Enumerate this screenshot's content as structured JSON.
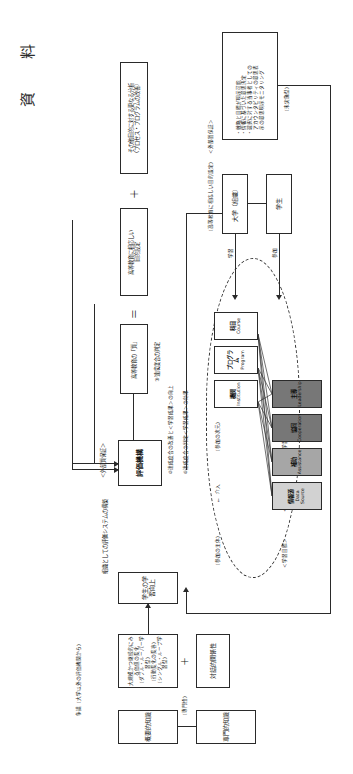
{
  "document": {
    "title": "資　料",
    "orientation": "landscape-rotated"
  },
  "top_boxes": {
    "other_purposes": "その他目的に対する更なる分析\n（プロセス・プログラムの改善）",
    "plus_sign": "＋",
    "target_setting": "高等教育に相応しい\n目的設定",
    "equals_sign": "＝",
    "quality_determination": "高等教育の「質」",
    "measure_quality": "③達成度合の判定",
    "organization_construction": "組織としての評価システムの構築"
  },
  "eval_org": {
    "label": "＜外部質保証＞",
    "box": "評価機構",
    "note_improve": "②達成度合の改善と＜学習成果＞の向上",
    "note_achieve": "①達成度合の判定＜学習成果＞の効果"
  },
  "outcomes": {
    "student_learning": "学生の学習向上",
    "value_add": "大規模かつ継続的にみる価値の変化\n（ダブル・ルーパー学習型）\n（行動変化の変容）\n（シングル・ループ学習型）",
    "interactivity": "対話的関係性",
    "competency": "概要的知識",
    "expertise_field": "専門的知識",
    "expertise_note": "（専門性）",
    "assessment_field": "専門的知識",
    "top_right_box": "手段的知識",
    "top_right_note": "（大学以外の評価機関から）",
    "link_label": "争議（大学以外の評価機関から）",
    "plus_sign": "＋"
  },
  "oval": {
    "headers": {
      "learning_goal": "＜学習目標＞",
      "learning_outcome": "＜学習成果＞",
      "learning_experience": "＜学習経験＞",
      "subject_level": "（参加の次元）",
      "subject_actor": "（参加の主体）",
      "intervene": "介入",
      "intervene_arrow": "←"
    },
    "columns": [
      {
        "top": {
          "jp": "機関",
          "en": "Institution"
        },
        "bottom": {
          "jp": "主導",
          "en": "Leadership",
          "fill": "gray-dark"
        }
      },
      {
        "top": {
          "jp": "プログラム",
          "en": "Program"
        },
        "bottom": {
          "jp": "協同",
          "en": "Cooperation",
          "fill": "gray-dark"
        }
      },
      {
        "top": {
          "jp": "科目",
          "en": "Course"
        },
        "bottom": {
          "jp": "補助",
          "en": "Assistance",
          "fill": "gray-mid"
        }
      },
      {
        "top": {
          "jp": "",
          "en": ""
        },
        "bottom": {
          "jp": "情報源",
          "en": "Data Source",
          "fill": "gray-light"
        }
      }
    ]
  },
  "bottom": {
    "external_quality": "＜外部質保証＞",
    "internal_label": "（高等教育に相応しい目的設定）",
    "university_box": "大学（組織）",
    "student_box": "学生",
    "learning_arrow": "学習",
    "participation_arrow": "参加",
    "list_box": "・戦略と目標が明示可能\n・情報に基づいた意思決定\n・選択に対する当事者としての\n　アカウンタビリティの意思表\n　示の意思明示モニタリング",
    "list_box_note": "（未実施型）"
  },
  "colors": {
    "ink": "#2a2a2a",
    "fill_dark": "#777777",
    "fill_mid": "#a6a6a6",
    "fill_light": "#d2d2d2",
    "paper": "#ffffff"
  }
}
